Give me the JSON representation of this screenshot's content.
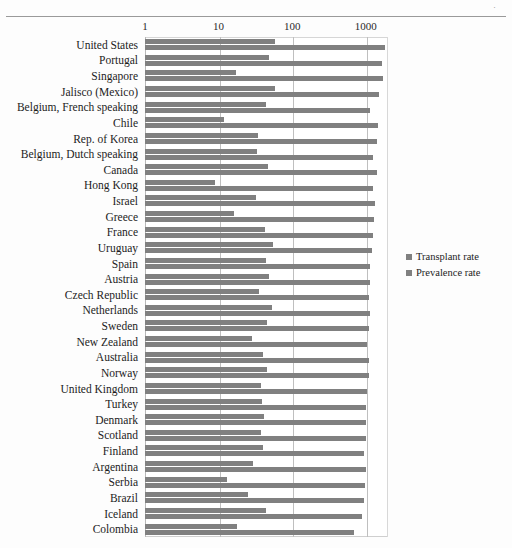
{
  "page": {
    "header_mark": "·"
  },
  "legend": {
    "position": "right-middle",
    "items": [
      {
        "label": "Transplant rate",
        "color": "#808080",
        "icon": "legend-square"
      },
      {
        "label": "Prevalence rate",
        "color": "#808080",
        "icon": "legend-square"
      }
    ]
  },
  "chart_data": {
    "type": "bar",
    "orientation": "horizontal",
    "title": "",
    "subtitle": "",
    "xlabel": "",
    "ylabel": "",
    "xscale": "log",
    "xlim": [
      1,
      2000
    ],
    "grid": true,
    "ticks": [
      {
        "value": 1,
        "label": "1"
      },
      {
        "value": 10,
        "label": "10"
      },
      {
        "value": 100,
        "label": "100"
      },
      {
        "value": 1000,
        "label": "1000"
      }
    ],
    "categories": [
      "United States",
      "Portugal",
      "Singapore",
      "Jalisco (Mexico)",
      "Belgium, French speaking",
      "Chile",
      "Rep. of Korea",
      "Belgium, Dutch speaking",
      "Canada",
      "Hong Kong",
      "Israel",
      "Greece",
      "France",
      "Uruguay",
      "Spain",
      "Austria",
      "Czech Republic",
      "Netherlands",
      "Sweden",
      "New Zealand",
      "Australia",
      "Norway",
      "United Kingdom",
      "Turkey",
      "Denmark",
      "Scotland",
      "Finland",
      "Argentina",
      "Serbia",
      "Brazil",
      "Iceland",
      "Colombia"
    ],
    "series": [
      {
        "name": "Transplant rate",
        "color": "#808080",
        "values": [
          59,
          48,
          17,
          58,
          44,
          12,
          34,
          33,
          47,
          9,
          32,
          16,
          43,
          55,
          44,
          48,
          35,
          53,
          46,
          28,
          40,
          45,
          38,
          39,
          41,
          38,
          40,
          29,
          13,
          25,
          44,
          18
        ]
      },
      {
        "name": "Prevalence rate",
        "color": "#808080",
        "values": [
          1800,
          1650,
          1700,
          1500,
          1150,
          1450,
          1400,
          1250,
          1400,
          1250,
          1350,
          1300,
          1250,
          1200,
          1150,
          1150,
          1100,
          1150,
          1100,
          1050,
          1100,
          1100,
          1050,
          1000,
          1000,
          1000,
          950,
          1000,
          980,
          950,
          900,
          700
        ]
      }
    ]
  }
}
